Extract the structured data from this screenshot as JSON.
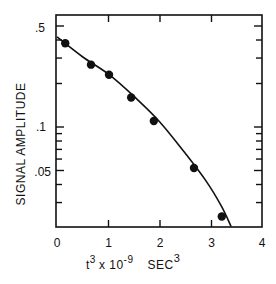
{
  "chart_data": {
    "type": "scatter",
    "title": "",
    "xlabel": "t³ x 10⁻⁹   SEC³",
    "xlabel_parts": {
      "main": "t",
      "main_sup": "3",
      "mult": " x 10",
      "mult_sup": "-9",
      "unit": "SEC",
      "unit_sup": "3"
    },
    "ylabel": "SIGNAL AMPLITUDE",
    "xlim": [
      0,
      4
    ],
    "ylim": [
      0.02,
      0.6
    ],
    "yscale": "log",
    "grid": false,
    "legend": null,
    "x_ticks": [
      0,
      1,
      2,
      3,
      4
    ],
    "x_tick_labels": [
      "0",
      "1",
      "2",
      "3",
      "4"
    ],
    "y_ticks_major": [
      0.5,
      0.1,
      0.05
    ],
    "y_tick_labels": [
      ".5",
      ".1",
      ".05"
    ],
    "y_ticks_minor": [
      0.4,
      0.3,
      0.2,
      0.09,
      0.08,
      0.07,
      0.06,
      0.04,
      0.03
    ],
    "series": [
      {
        "name": "measured",
        "style": "filled-circle",
        "x": [
          0.16,
          0.66,
          1.01,
          1.44,
          1.88,
          2.66,
          3.2
        ],
        "y": [
          0.38,
          0.27,
          0.23,
          0.16,
          0.11,
          0.052,
          0.024
        ]
      },
      {
        "name": "fit-curve",
        "style": "line",
        "x": [
          0.0,
          0.5,
          1.0,
          1.5,
          2.0,
          2.5,
          2.9,
          3.2,
          3.38
        ],
        "y": [
          0.42,
          0.305,
          0.232,
          0.162,
          0.108,
          0.065,
          0.042,
          0.028,
          0.0205
        ]
      }
    ]
  },
  "labels": {
    "x_t": "t",
    "x_t_sup": "3",
    "x_mult": "x 10",
    "x_mult_sup": "-9",
    "x_unit": "SEC",
    "x_unit_sup": "3",
    "y_axis": "SIGNAL  AMPLITUDE",
    "x_ticks": [
      "0",
      "1",
      "2",
      "3",
      "4"
    ],
    "y_ticks": [
      ".5",
      ".1",
      ".05"
    ]
  }
}
